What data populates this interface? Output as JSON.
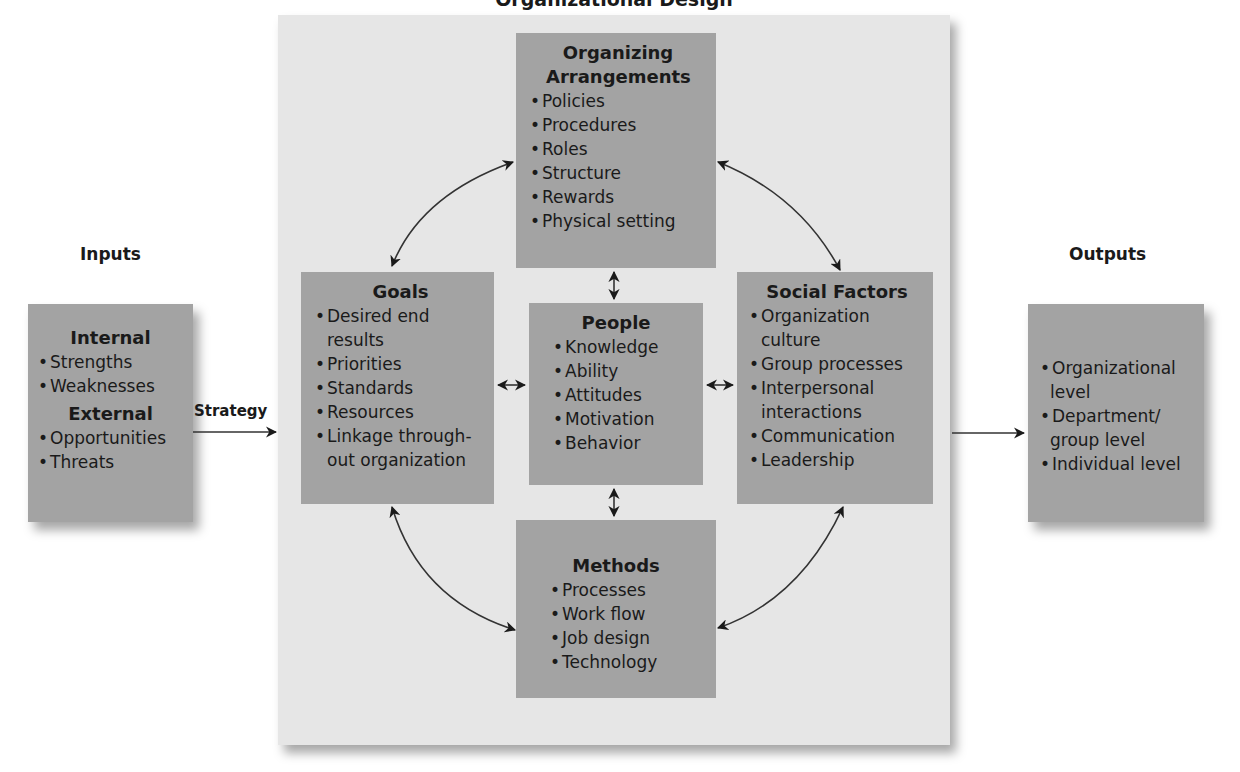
{
  "title": "Organizational Design",
  "inputs": {
    "label": "Inputs",
    "sections": [
      {
        "heading": "Internal",
        "items": [
          "Strengths",
          "Weaknesses"
        ]
      },
      {
        "heading": "External",
        "items": [
          "Opportunities",
          "Threats"
        ]
      }
    ]
  },
  "strategy_label": "Strategy",
  "outputs": {
    "label": "Outputs",
    "items": [
      "Organizational level",
      "Department/ group level",
      "Individual level"
    ]
  },
  "organizing_arrangements": {
    "heading": "Organizing Arrangements",
    "items": [
      "Policies",
      "Procedures",
      "Roles",
      "Structure",
      "Rewards",
      "Physical setting"
    ]
  },
  "goals": {
    "heading": "Goals",
    "items": [
      "Desired end results",
      "Priorities",
      "Standards",
      "Resources",
      "Linkage through-out organization"
    ]
  },
  "people": {
    "heading": "People",
    "items": [
      "Knowledge",
      "Ability",
      "Attitudes",
      "Motivation",
      "Behavior"
    ]
  },
  "social_factors": {
    "heading": "Social Factors",
    "items": [
      "Organization culture",
      "Group processes",
      "Interpersonal interactions",
      "Communication",
      "Leadership"
    ]
  },
  "methods": {
    "heading": "Methods",
    "items": [
      "Processes",
      "Work flow",
      "Job design",
      "Technology"
    ]
  },
  "colors": {
    "panel": "#e6e6e6",
    "box": "#a3a3a3",
    "arrow": "#1a1a1a"
  }
}
